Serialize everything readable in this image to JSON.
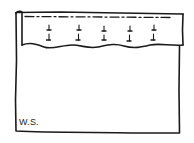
{
  "diagram": {
    "type": "sewing-hem-illustration",
    "label": "W.S.",
    "label_meaning": "wrong side",
    "parts": {
      "fabric": "fabric-panel",
      "hem": "folded-hem",
      "stitch_line": "dashed-stitch-line",
      "pins": {
        "count": 5,
        "x_positions": [
          48,
          78,
          104,
          130,
          154
        ]
      }
    },
    "colors": {
      "ink": "#1a1a1a",
      "background": "#ffffff"
    }
  }
}
